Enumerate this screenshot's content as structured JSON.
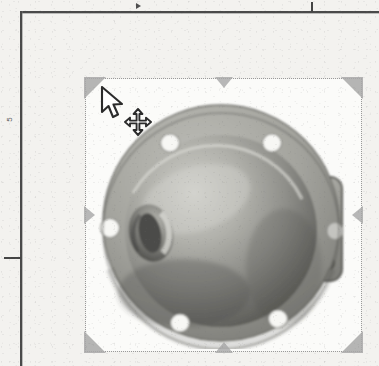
{
  "window": {
    "title": "Scanned document page — image object selected",
    "background_color": "#f3f2ef",
    "width": 379,
    "height": 366
  },
  "page_frame": {
    "name": "document-margin-frame",
    "line_color": "#4a4a4a",
    "top_rule_y": 11,
    "left_rule_x": 20,
    "ruler_label_left": "5",
    "ticks": [
      {
        "name": "top-tab-stop-marker",
        "orientation": "vertical",
        "x": 311
      },
      {
        "name": "top-indent-arrow-marker",
        "orientation": "arrow-left",
        "x": 136
      },
      {
        "name": "left-margin-tick",
        "orientation": "horizontal",
        "y": 257
      }
    ]
  },
  "selection": {
    "name": "image-selection-frame",
    "border_style": "dotted",
    "border_color": "#9a9a9a",
    "handle_color": "#a8a8a8",
    "x": 85,
    "y": 78,
    "width": 277,
    "height": 274,
    "corner_handles": [
      "top-left",
      "top-right",
      "bottom-left",
      "bottom-right"
    ],
    "edge_handles": [
      "top-center",
      "bottom-center",
      "left-center",
      "right-center"
    ]
  },
  "photo": {
    "name": "mechanical-part-photograph",
    "alt": "Grayscale photograph of a cast metal pump housing / valve cover",
    "mat_color": "#fbfbf9",
    "subject": "cast metal pump housing with circular bolt flange, domed body, side boss port and square outlet flange",
    "features": {
      "flange_bolt_holes": 6,
      "outlet_flange_bolt_holes": 4,
      "side_boss_ports": 1,
      "center_outlet_ports": 1
    },
    "tones": {
      "highlight": "#d3d3ce",
      "midtone": "#9d9d98",
      "shadow": "#5e5e5b",
      "deep_shadow": "#3d3d3b",
      "hole_fill": "#f7f7f4"
    }
  },
  "cursor": {
    "pointer": {
      "name": "arrow-pointer-cursor",
      "x": 100,
      "y": 86,
      "fill": "#ffffff",
      "stroke": "#2b2b2b"
    },
    "modifier": {
      "name": "move-four-way-arrow-cursor",
      "x": 124,
      "y": 108,
      "fill": "#ffffff",
      "stroke": "#2b2b2b"
    }
  }
}
